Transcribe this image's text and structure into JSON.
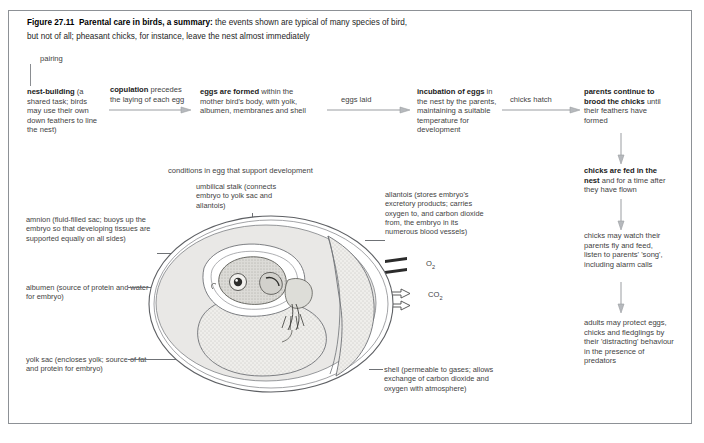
{
  "figure": {
    "number": "Figure 27.11",
    "title": "Parental care in birds, a summary:",
    "subtitle_line1": " the events shown are typical of many species of bird,",
    "subtitle_line2": "but not of all; pheasant chicks, for instance, leave the nest almost immediately"
  },
  "flow": {
    "pairing": "pairing",
    "steps": [
      {
        "id": "nest-building",
        "bold": "nest-building",
        "rest": " (a shared task; birds may use their own down feathers to line the nest)"
      },
      {
        "id": "eggs-formed",
        "bold": "eggs are formed",
        "rest": " within the mother bird's body, with yolk, albumen, membranes and shell"
      },
      {
        "id": "incubation",
        "bold": "incubation of eggs",
        "rest": " in the nest by the parents, maintaining a suitable temperature for development"
      },
      {
        "id": "brooding",
        "bold": "parents continue to brood the chicks",
        "rest": " until their feathers have formed"
      },
      {
        "id": "chicks-fed",
        "bold": "chicks are fed in the nest",
        "rest": " and for a time after they have flown"
      },
      {
        "id": "chicks-watch",
        "bold": "",
        "rest": "chicks may watch their parents fly and feed, listen to parents' 'song', including alarm calls"
      },
      {
        "id": "adults-protect",
        "bold": "",
        "rest": "adults may protect eggs, chicks and fledglings by their 'distracting' behaviour in the presence of predators"
      }
    ],
    "connectors": [
      {
        "id": "copulation",
        "bold": "copulation",
        "rest": " precedes the laying of each egg"
      },
      {
        "id": "eggs-laid",
        "bold": "",
        "rest": "eggs laid"
      },
      {
        "id": "chicks-hatch",
        "bold": "",
        "rest": "chicks hatch"
      }
    ]
  },
  "egg": {
    "heading": "conditions in egg that support development",
    "labels": [
      {
        "id": "umbilical-stalk",
        "text": "umbilical stalk (connects embryo to yolk sac and allantois)"
      },
      {
        "id": "allantois",
        "text": "allantois (stores embryo's excretory products; carries oxygen to, and carbon dioxide from, the embryo in its numerous blood vessels)"
      },
      {
        "id": "amnion",
        "text": "amnion (fluid-filled sac; buoys up the embryo so that developing tissues are supported equally on all sides)"
      },
      {
        "id": "albumen",
        "text": "albumen (source of protein and water for embryo)"
      },
      {
        "id": "yolk-sac",
        "text": "yolk sac (encloses yolk; source of fat and protein for embryo)"
      },
      {
        "id": "shell",
        "text": "shell (permeable to gases; allows exchange of carbon dioxide and oxygen with atmosphere)"
      }
    ],
    "gases": {
      "oxygen": "O",
      "oxygen_sub": "2",
      "carbon_dioxide": "CO",
      "carbon_dioxide_sub": "2"
    }
  },
  "colors": {
    "frame_border": "#8d9196",
    "text": "#3f3f3f",
    "heading_text": "#1d1d1d",
    "connector_line": "#8a8d91",
    "albumen_fill": "#e7e7e5",
    "yolk_fill": "#efeeec",
    "embryo_fill": "#d9d8d4",
    "shell_stroke": "#6f7276"
  }
}
